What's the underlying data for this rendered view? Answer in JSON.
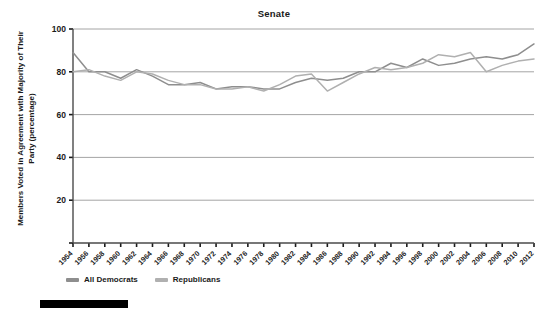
{
  "chart_data": {
    "type": "line",
    "title": "Senate",
    "xlabel": "",
    "ylabel": "Members Voted in Agreement with Majority of Their Party (percentage)",
    "ylim": [
      0,
      100
    ],
    "yticks": [
      0,
      20,
      40,
      60,
      80,
      100
    ],
    "ytick_labels": [
      "",
      "20",
      "40",
      "60",
      "80",
      "100"
    ],
    "grid": true,
    "legend_position": "bottom-left",
    "x": [
      1954,
      1956,
      1958,
      1960,
      1962,
      1964,
      1966,
      1968,
      1970,
      1972,
      1974,
      1976,
      1978,
      1980,
      1982,
      1984,
      1986,
      1988,
      1990,
      1992,
      1994,
      1996,
      1998,
      2000,
      2002,
      2004,
      2006,
      2008,
      2010,
      2012
    ],
    "xtick_labels": [
      "1954",
      "1956",
      "1958",
      "1960",
      "1962",
      "1964",
      "1966",
      "1968",
      "1970",
      "1972",
      "1974",
      "1976",
      "1978",
      "1980",
      "1982",
      "1984",
      "1986",
      "1988",
      "1990",
      "1992",
      "1994",
      "1996",
      "1998",
      "2000",
      "2002",
      "2004",
      "2006",
      "2008",
      "2010",
      "2012"
    ],
    "series": [
      {
        "name": "All Democrats",
        "color": "#8e8e8e",
        "values": [
          89,
          80,
          80,
          77,
          81,
          78,
          74,
          74,
          75,
          72,
          73,
          73,
          72,
          72,
          75,
          77,
          76,
          77,
          80,
          80,
          84,
          82,
          86,
          83,
          84,
          86,
          87,
          86,
          88,
          93
        ]
      },
      {
        "name": "Republicans",
        "color": "#b0b0b0",
        "values": [
          80,
          81,
          78,
          76,
          80,
          79,
          76,
          74,
          74,
          72,
          72,
          73,
          71,
          74,
          78,
          79,
          71,
          75,
          79,
          82,
          81,
          82,
          84,
          88,
          87,
          89,
          80,
          83,
          85,
          86
        ]
      }
    ]
  },
  "legend": {
    "entries": [
      {
        "label": "All Democrats"
      },
      {
        "label": "Republicans"
      }
    ]
  }
}
